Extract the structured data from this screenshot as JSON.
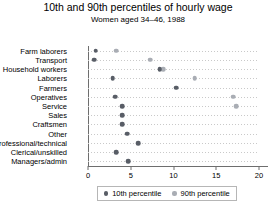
{
  "chart_data": {
    "type": "scatter",
    "title": "10th and 90th percentiles of hourly wage",
    "subtitle": "Women aged 34–46, 1988",
    "xlabel": "",
    "ylabel": "",
    "xlim": [
      0,
      20
    ],
    "xticks": [
      0,
      5,
      10,
      15,
      20
    ],
    "xtick_labels": [
      "0",
      "5",
      "10",
      "15",
      "20"
    ],
    "grid": "horizontal-dotted",
    "legend_position": "bottom",
    "categories": [
      "Farm laborers",
      "Transport",
      "Household workers",
      "Laborers",
      "Farmers",
      "Operatives",
      "Service",
      "Sales",
      "Craftsmen",
      "Other",
      "Professional/technical",
      "Clerical/unskilled",
      "Managers/admin"
    ],
    "series": [
      {
        "name": "10th percentile",
        "color": "#585d66",
        "marker": "circle",
        "values": [
          0.9,
          0.7,
          8.4,
          2.9,
          10.3,
          3.2,
          4.0,
          4.0,
          4.0,
          4.6,
          5.9,
          3.3,
          4.7
        ]
      },
      {
        "name": "90th percentile",
        "color": "#a9adb4",
        "marker": "circle",
        "values": [
          3.3,
          7.3,
          8.8,
          12.5,
          20.5,
          17.0,
          17.3,
          23.4,
          27.0,
          32.5,
          40.2,
          43.0,
          50.0
        ]
      }
    ],
    "series_display": [
      {
        "name": "10th percentile",
        "points": [
          0.9,
          0.7,
          8.4,
          2.9,
          10.3,
          3.2,
          4.0,
          4.0,
          4.0,
          4.6,
          5.9,
          3.3,
          4.7
        ]
      },
      {
        "name": "90th percentile",
        "points": [
          3.3,
          7.3,
          8.8,
          12.5,
          13.5,
          17.0,
          17.3,
          23.4,
          27.0,
          32.5,
          40.2,
          43.0,
          50.0
        ]
      }
    ]
  },
  "rows": [
    {
      "label": "Farm laborers",
      "p10": 0.9,
      "p90": 3.3
    },
    {
      "label": "Transport",
      "p10": 0.7,
      "p90": 7.3
    },
    {
      "label": "Household workers",
      "p10": 8.4,
      "p90": 8.8
    },
    {
      "label": "Laborers",
      "p10": 2.9,
      "p90": 12.5
    },
    {
      "label": "Farmers",
      "p10": 10.3,
      "p90": null
    },
    {
      "label": "Operatives",
      "p10": 3.2,
      "p90": 17.0
    },
    {
      "label": "Service",
      "p10": 4.0,
      "p90": 17.3
    },
    {
      "label": "Sales",
      "p10": 4.0,
      "p90": 23.4
    },
    {
      "label": "Craftsmen",
      "p10": 4.0,
      "p90": 27.0
    },
    {
      "label": "Other",
      "p10": 4.6,
      "p90": 32.5
    },
    {
      "label": "Professional/technical",
      "p10": 5.9,
      "p90": 40.2
    },
    {
      "label": "Clerical/unskilled",
      "p10": 3.3,
      "p90": 43.0
    },
    {
      "label": "Managers/admin",
      "p10": 4.7,
      "p90": 50.0
    }
  ],
  "legend": {
    "items": [
      {
        "label": "10th percentile",
        "color": "#585d66"
      },
      {
        "label": "90th percentile",
        "color": "#a9adb4"
      }
    ]
  },
  "colors": {
    "p10": "#585d66",
    "p90": "#a9adb4",
    "axis": "#6e6e6e",
    "grid": "#c9c9c9"
  }
}
